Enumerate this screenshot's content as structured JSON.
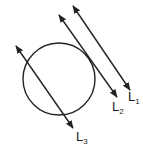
{
  "figure": {
    "circle": {
      "cx": 59,
      "cy": 79,
      "r": 36
    },
    "lines": [
      {
        "id": "L1",
        "name": "L",
        "sub": "1",
        "relation": "no intersection",
        "x1": 73,
        "y1": 6,
        "x2": 130,
        "y2": 90
      },
      {
        "id": "L2",
        "name": "L",
        "sub": "2",
        "relation": "tangent",
        "x1": 59,
        "y1": 15,
        "x2": 117,
        "y2": 97
      },
      {
        "id": "L3",
        "name": "L",
        "sub": "3",
        "relation": "secant",
        "x1": 16,
        "y1": 46,
        "x2": 73,
        "y2": 128
      }
    ],
    "stroke_color": "#222222"
  }
}
